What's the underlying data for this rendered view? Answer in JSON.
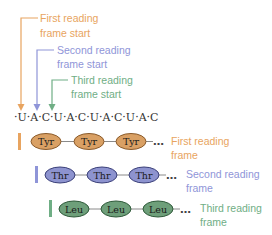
{
  "colors": {
    "first": "#e8a460",
    "first_fill": "#d9a064",
    "first_stroke": "#8a5a2a",
    "second": "#8f95d8",
    "second_fill": "#8d93cf",
    "second_stroke": "#3a3f78",
    "third": "#6fae85",
    "third_fill": "#6e9f7a",
    "third_stroke": "#2f5a3a",
    "connector": "#8a8a8a",
    "text": "#333333"
  },
  "frame_starts": [
    {
      "line1": "First reading",
      "line2": "frame start"
    },
    {
      "line1": "Second reading",
      "line2": "frame start"
    },
    {
      "line1": "Third reading",
      "line2": "frame start"
    }
  ],
  "sequence": {
    "bases": [
      "U",
      "A",
      "C",
      "U",
      "A",
      "C",
      "U",
      "A",
      "C",
      "U",
      "A",
      "C"
    ],
    "text": "·U·A·C·U·A·C·U·A·C·U·A·C"
  },
  "frames": [
    {
      "amino_acids": [
        "Tyr",
        "Tyr",
        "Tyr"
      ],
      "ellipsis": "…",
      "label_line1": "First reading",
      "label_line2": "frame"
    },
    {
      "amino_acids": [
        "Thr",
        "Thr",
        "Thr"
      ],
      "ellipsis": "…",
      "label_line1": "Second reading",
      "label_line2": "frame"
    },
    {
      "amino_acids": [
        "Leu",
        "Leu",
        "Leu"
      ],
      "ellipsis": "…",
      "label_line1": "Third reading",
      "label_line2": "frame"
    }
  ]
}
